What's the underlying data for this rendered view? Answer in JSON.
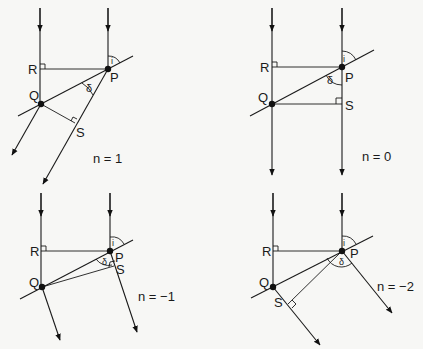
{
  "diagram": {
    "panels": [
      {
        "id": "panel-n1",
        "n_label": "n = 1",
        "points": {
          "P": "P",
          "Q": "Q",
          "R": "R",
          "S": "S"
        },
        "angles": {
          "incidence": "i",
          "deviation": "δ"
        }
      },
      {
        "id": "panel-n0",
        "n_label": "n = 0",
        "points": {
          "P": "P",
          "Q": "Q",
          "R": "R",
          "S": "S"
        },
        "angles": {
          "incidence": "i",
          "deviation": "δ"
        }
      },
      {
        "id": "panel-n-1",
        "n_label": "n = −1",
        "points": {
          "P": "P",
          "Q": "Q",
          "R": "R",
          "S": "S"
        },
        "angles": {
          "incidence": "i",
          "deviation": "δ"
        }
      },
      {
        "id": "panel-n-2",
        "n_label": "n = −2",
        "points": {
          "P": "P",
          "Q": "Q",
          "R": "R",
          "S": "S"
        },
        "angles": {
          "incidence": "i",
          "deviation": "δ"
        }
      }
    ]
  }
}
